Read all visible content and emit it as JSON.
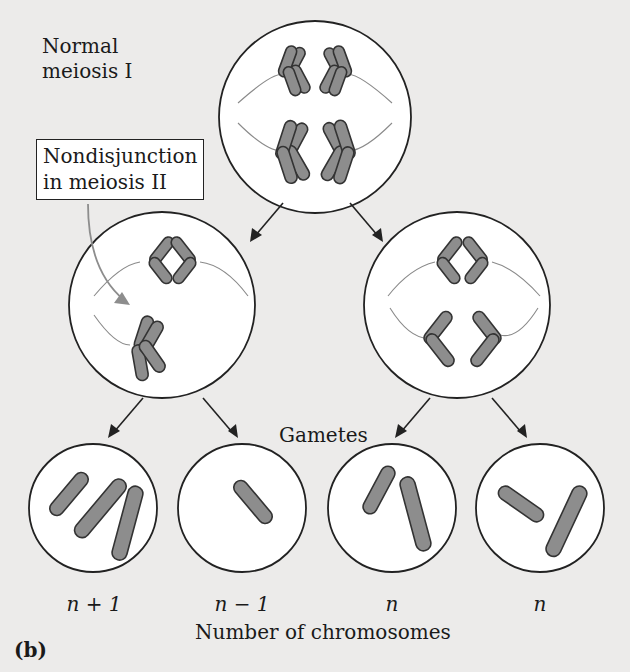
{
  "figure": {
    "panel_label": "(b)",
    "title_label": "Normal\nmeiosis I",
    "callout_label": "Nondisjunction\nin meiosis II",
    "gametes_label": "Gametes",
    "axis_label": "Number of chromosomes",
    "gamete_counts": [
      "n + 1",
      "n − 1",
      "n",
      "n"
    ]
  },
  "colors": {
    "background": "#ecebea",
    "cell_fill": "#ffffff",
    "chromosome_fill": "#8d8d8d",
    "outline": "#222222",
    "spindle": "#8a8a8a",
    "callout_arrow": "#8d8d8d"
  },
  "stages": [
    {
      "name": "meiosis-I-cell",
      "chromosome_pairs": 4
    },
    {
      "name": "meiosis-II-left-cell",
      "state": "nondisjunction"
    },
    {
      "name": "meiosis-II-right-cell",
      "state": "normal"
    }
  ]
}
